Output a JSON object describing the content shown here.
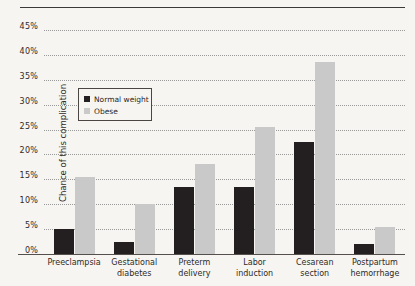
{
  "chart_data": {
    "type": "bar",
    "title": "",
    "xlabel": "",
    "ylabel": "Chance of this complication",
    "categories": [
      "Preeclampsia",
      "Gestational diabetes",
      "Preterm delivery",
      "Labor induction",
      "Cesarean section",
      "Postpartum hemorrhage"
    ],
    "category_lines": [
      [
        "Preeclampsia"
      ],
      [
        "Gestational",
        "diabetes"
      ],
      [
        "Preterm",
        "delivery"
      ],
      [
        "Labor",
        "induction"
      ],
      [
        "Cesarean",
        "section"
      ],
      [
        "Postpartum",
        "hemorrhage"
      ]
    ],
    "series": [
      {
        "name": "Normal weight",
        "color": "#231f20",
        "values": [
          5,
          2.5,
          13.5,
          13.5,
          22.5,
          2
        ]
      },
      {
        "name": "Obese",
        "color": "#c9c9c9",
        "values": [
          15.5,
          10,
          18,
          25.5,
          38.5,
          5.5
        ]
      }
    ],
    "ylim": [
      0,
      45
    ],
    "ytick_values": [
      0,
      5,
      10,
      15,
      20,
      25,
      30,
      35,
      40,
      45
    ],
    "ytick_labels": [
      "0%",
      "5%",
      "10%",
      "15%",
      "20%",
      "25%",
      "30%",
      "35%",
      "40%",
      "45%"
    ],
    "unit": "%",
    "grid": "horizontal-dotted",
    "legend_position": "inside-upper-left"
  },
  "legend": {
    "entries": [
      {
        "label": "Normal weight",
        "color": "#231f20"
      },
      {
        "label": "Obese",
        "color": "#c9c9c9"
      }
    ]
  },
  "colors": {
    "background": "#f6f5f1",
    "normal_weight": "#231f20",
    "obese": "#c9c9c9",
    "gridline": "#9a9a9a",
    "axis": "#55504d",
    "text": "#2e2a28"
  }
}
